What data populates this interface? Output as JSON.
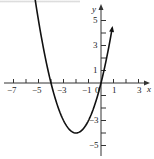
{
  "chart_data": {
    "type": "line",
    "title": "",
    "xlabel": "x",
    "ylabel": "y",
    "xlim": [
      -7.8,
      3.6
    ],
    "ylim": [
      -6,
      6
    ],
    "grid": false,
    "x_ticks": [
      -7,
      -6,
      -5,
      -4,
      -3,
      -2,
      -1,
      1,
      2,
      3
    ],
    "x_tick_labels": [
      "-7",
      "-5",
      "-3",
      "-1",
      "0",
      "1",
      "3"
    ],
    "y_tick_labels": [
      "5",
      "3",
      "1",
      "-3",
      "-5"
    ],
    "series": [
      {
        "name": "parabola",
        "equation": "y = x^2 + 4x",
        "x": [
          -5.9,
          -5,
          -4,
          -3,
          -2,
          -1,
          0,
          0.9
        ],
        "y": [
          11.2,
          5,
          0,
          -3,
          -4,
          -3,
          0,
          4.4
        ],
        "vertex": [
          -2,
          -4
        ],
        "roots": [
          -4,
          0
        ]
      }
    ]
  },
  "labels": {
    "x_axis": "x",
    "y_axis": "y",
    "xt_m7": "−7",
    "xt_m5": "−5",
    "xt_m3": "−3",
    "xt_m1": "−1",
    "xt_0": "0",
    "xt_1": "1",
    "xt_3": "3",
    "yt_5": "5",
    "yt_3": "3",
    "yt_1": "1",
    "yt_m3": "−3",
    "yt_m5": "−5"
  }
}
